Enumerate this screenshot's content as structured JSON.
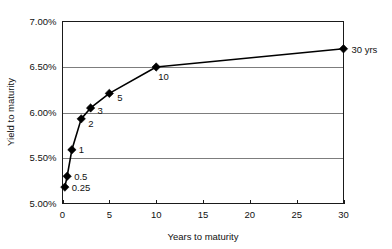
{
  "chart_data": {
    "type": "line",
    "title": "",
    "subtitle": "",
    "xlabel": "Years to maturity",
    "ylabel": "Yield to maturity",
    "xlim": [
      0,
      30
    ],
    "ylim": [
      5.0,
      7.0
    ],
    "grid": "horizontal",
    "legend": "none",
    "x_ticks": [
      0,
      5,
      10,
      15,
      20,
      25,
      30
    ],
    "x_tick_labels": [
      "0",
      "5",
      "10",
      "15",
      "20",
      "25",
      "30"
    ],
    "y_ticks": [
      5.0,
      5.5,
      6.0,
      6.5,
      7.0
    ],
    "y_tick_labels": [
      "5.00%",
      "5.50%",
      "6.00%",
      "6.50%",
      "7.00%"
    ],
    "x": [
      0.25,
      0.5,
      1,
      2,
      3,
      5,
      10,
      30
    ],
    "values": [
      5.18,
      5.3,
      5.59,
      5.93,
      6.05,
      6.21,
      6.5,
      6.7
    ],
    "point_labels": [
      "0.25",
      "0.5",
      "1",
      "2",
      "3",
      "5",
      "10",
      "30 yrs"
    ],
    "series": [
      {
        "name": "Yield curve",
        "x": [
          0.25,
          0.5,
          1,
          2,
          3,
          5,
          10,
          30
        ],
        "values": [
          5.18,
          5.3,
          5.59,
          5.93,
          6.05,
          6.21,
          6.5,
          6.7
        ],
        "marker": "diamond",
        "color": "#000000"
      }
    ],
    "colors": {
      "line": "#000000",
      "marker": "#000000",
      "gridline": "#7d7d7d",
      "axis": "#1a1a1a",
      "background": "#ffffff",
      "text": "#111111"
    }
  }
}
